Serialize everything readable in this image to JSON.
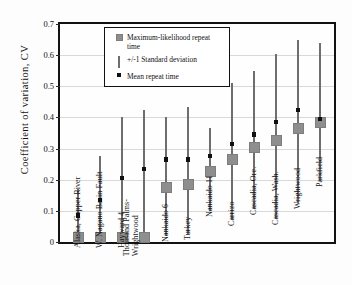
{
  "chart_data": {
    "type": "scatter",
    "title": "",
    "xlabel": "",
    "ylabel": "Coefficient of variation, CV",
    "ylim": [
      0,
      0.7
    ],
    "yticks": [
      0,
      0.1,
      0.2,
      0.3,
      0.4,
      0.5,
      0.6,
      0.7
    ],
    "ytick_labels": [
      "0",
      "0.1",
      "0.2",
      "0.3",
      "0.4",
      "0.5",
      "0.6",
      "0.7"
    ],
    "grid": true,
    "legend_position": "top-center",
    "legend": [
      {
        "key": "ml-square-marker",
        "label": "Maximum-likelihood repeat time"
      },
      {
        "key": "vertical-line-marker",
        "label": "+/-1 Standard deviation"
      },
      {
        "key": "small-square-marker",
        "label": "Mean repeat time"
      }
    ],
    "categories": [
      "Alaska, Copper River",
      "W. Nagano Basin Fault",
      "Hayward 4",
      "Thousand Palms-Wrightwood",
      "Nankaido 6",
      "Turkey",
      "Nankaido 11",
      "Carrizo",
      "Cascadia, Ore.",
      "Cascadia, Wash.",
      "Wrightwood",
      "Parkfield"
    ],
    "series": [
      {
        "name": "Maximum-likelihood repeat time",
        "marker": "ml-square-marker",
        "values": [
          0.015,
          0.015,
          0.015,
          0.015,
          0.175,
          0.185,
          0.225,
          0.265,
          0.305,
          0.325,
          0.365,
          0.385
        ]
      },
      {
        "name": "Mean repeat time",
        "marker": "small-square-marker",
        "values": [
          0.085,
          0.135,
          0.205,
          0.235,
          0.265,
          0.265,
          0.275,
          0.315,
          0.345,
          0.385,
          0.425,
          0.395
        ]
      },
      {
        "name": "+/-1 Standard deviation",
        "marker": "vertical-line-marker",
        "low": [
          0.0,
          0.0,
          0.0,
          0.0,
          0.02,
          0.025,
          0.1,
          0.07,
          0.105,
          0.075,
          0.125,
          0.195
        ],
        "high": [
          0.17,
          0.275,
          0.4,
          0.425,
          0.4,
          0.435,
          0.365,
          0.51,
          0.55,
          0.605,
          0.65,
          0.64
        ]
      }
    ]
  }
}
